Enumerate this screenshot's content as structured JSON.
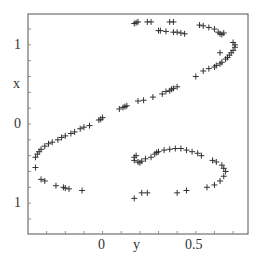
{
  "chart_data": {
    "type": "scatter",
    "title": "",
    "xlabel": "y",
    "ylabel": "x",
    "marker": "+",
    "marker_color": "#333333",
    "grid": false,
    "legend": null,
    "xlim": [
      -0.4,
      0.78
    ],
    "ylim": [
      -1.39,
      1.39
    ],
    "x_ticks": [
      {
        "value": 0,
        "label": "0"
      },
      {
        "value": 0.5,
        "label": "0.5"
      }
    ],
    "y_ticks": [
      {
        "value": 1,
        "label": "1"
      },
      {
        "value": 0,
        "label": "0"
      },
      {
        "value": -1,
        "label": "1"
      }
    ],
    "points": [
      [
        0.17,
        1.27
      ],
      [
        0.18,
        1.28
      ],
      [
        0.19,
        1.29
      ],
      [
        0.24,
        1.29
      ],
      [
        0.26,
        1.29
      ],
      [
        0.36,
        1.29
      ],
      [
        0.38,
        1.29
      ],
      [
        0.3,
        1.18
      ],
      [
        0.31,
        1.18
      ],
      [
        0.34,
        1.17
      ],
      [
        0.38,
        1.16
      ],
      [
        0.4,
        1.16
      ],
      [
        0.42,
        1.15
      ],
      [
        0.44,
        1.14
      ],
      [
        0.52,
        1.25
      ],
      [
        0.54,
        1.24
      ],
      [
        0.57,
        1.22
      ],
      [
        0.6,
        1.2
      ],
      [
        0.62,
        1.16
      ],
      [
        0.63,
        1.14
      ],
      [
        0.64,
        1.13
      ],
      [
        0.65,
        1.15
      ],
      [
        0.7,
        1.03
      ],
      [
        0.71,
        1.0
      ],
      [
        0.71,
        0.97
      ],
      [
        0.7,
        0.93
      ],
      [
        0.69,
        0.9
      ],
      [
        0.68,
        0.87
      ],
      [
        0.67,
        0.84
      ],
      [
        0.66,
        0.82
      ],
      [
        0.63,
        0.9
      ],
      [
        0.64,
        0.78
      ],
      [
        0.63,
        0.76
      ],
      [
        0.61,
        0.74
      ],
      [
        0.6,
        0.72
      ],
      [
        0.57,
        0.7
      ],
      [
        0.54,
        0.67
      ],
      [
        0.5,
        0.6
      ],
      [
        0.4,
        0.47
      ],
      [
        0.38,
        0.45
      ],
      [
        0.37,
        0.44
      ],
      [
        0.36,
        0.42
      ],
      [
        0.34,
        0.41
      ],
      [
        0.32,
        0.38
      ],
      [
        0.27,
        0.34
      ],
      [
        0.22,
        0.3
      ],
      [
        0.19,
        0.29
      ],
      [
        0.13,
        0.23
      ],
      [
        0.12,
        0.22
      ],
      [
        0.11,
        0.21
      ],
      [
        0.09,
        0.19
      ],
      [
        0.0,
        0.08
      ],
      [
        -0.01,
        0.06
      ],
      [
        -0.02,
        0.05
      ],
      [
        -0.07,
        -0.02
      ],
      [
        -0.1,
        -0.04
      ],
      [
        -0.12,
        -0.06
      ],
      [
        -0.15,
        -0.1
      ],
      [
        -0.17,
        -0.12
      ],
      [
        -0.2,
        -0.15
      ],
      [
        -0.22,
        -0.17
      ],
      [
        -0.24,
        -0.2
      ],
      [
        -0.27,
        -0.23
      ],
      [
        -0.29,
        -0.25
      ],
      [
        -0.31,
        -0.28
      ],
      [
        -0.33,
        -0.32
      ],
      [
        -0.34,
        -0.35
      ],
      [
        -0.35,
        -0.38
      ],
      [
        -0.36,
        -0.42
      ],
      [
        -0.36,
        -0.55
      ],
      [
        -0.33,
        -0.7
      ],
      [
        -0.31,
        -0.72
      ],
      [
        -0.25,
        -0.78
      ],
      [
        -0.21,
        -0.8
      ],
      [
        -0.2,
        -0.81
      ],
      [
        -0.18,
        -0.82
      ],
      [
        -0.11,
        -0.84
      ],
      [
        0.17,
        -0.94
      ],
      [
        0.21,
        -0.87
      ],
      [
        0.24,
        -0.87
      ],
      [
        0.4,
        -0.87
      ],
      [
        0.18,
        -0.4
      ],
      [
        0.17,
        -0.42
      ],
      [
        0.17,
        -0.46
      ],
      [
        0.19,
        -0.48
      ],
      [
        0.2,
        -0.49
      ],
      [
        0.21,
        -0.47
      ],
      [
        0.23,
        -0.44
      ],
      [
        0.26,
        -0.42
      ],
      [
        0.28,
        -0.38
      ],
      [
        0.29,
        -0.36
      ],
      [
        0.3,
        -0.35
      ],
      [
        0.33,
        -0.33
      ],
      [
        0.36,
        -0.32
      ],
      [
        0.39,
        -0.31
      ],
      [
        0.42,
        -0.31
      ],
      [
        0.45,
        -0.33
      ],
      [
        0.48,
        -0.35
      ],
      [
        0.51,
        -0.37
      ],
      [
        0.53,
        -0.4
      ],
      [
        0.59,
        -0.46
      ],
      [
        0.61,
        -0.48
      ],
      [
        0.64,
        -0.52
      ],
      [
        0.65,
        -0.56
      ],
      [
        0.66,
        -0.6
      ],
      [
        0.65,
        -0.66
      ],
      [
        0.63,
        -0.72
      ],
      [
        0.6,
        -0.77
      ],
      [
        0.56,
        -0.8
      ],
      [
        0.45,
        -0.84
      ]
    ]
  }
}
